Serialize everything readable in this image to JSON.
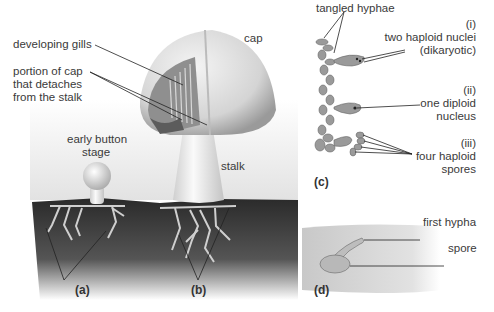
{
  "figure": {
    "panels": {
      "a": "(a)",
      "b": "(b)",
      "c": "(c)",
      "d": "(d)"
    },
    "labels": {
      "developing_gills": "developing gills",
      "cap_portion_line1": "portion of cap",
      "cap_portion_line2": "that detaches",
      "cap_portion_line3": "from the stalk",
      "cap": "cap",
      "early_button_line1": "early button",
      "early_button_line2": "stage",
      "stalk": "stalk",
      "tangled_hyphae": "tangled hyphae",
      "stage_i": "(i)",
      "stage_i_line1": "two haploid nuclei",
      "stage_i_line2": "(dikaryotic)",
      "stage_ii": "(ii)",
      "stage_ii_line1": "one diploid",
      "stage_ii_line2": "nucleus",
      "stage_iii": "(iii)",
      "stage_iii_line1": "four haploid",
      "stage_iii_line2": "spores",
      "first_hypha": "first hypha",
      "spore": "spore"
    }
  }
}
